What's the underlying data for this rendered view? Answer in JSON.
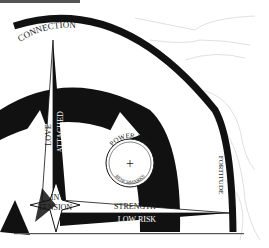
{
  "diagram": {
    "type": "compass-rose",
    "colors": {
      "ink": "#111111",
      "paper": "#ffffff",
      "contour": "#d8d8d8",
      "rule": "#555555"
    },
    "labels": {
      "north": "CONNECTION",
      "east": "FORTITUDE",
      "north_arm_left": "LOVE",
      "north_arm_right": "ATTACHED",
      "east_arm_top": "STRENGTH",
      "east_arm_bottom": "LOW RISK",
      "center_top": "IN",
      "center_bottom": "TENSION",
      "badge_top": "POWER FOR",
      "badge_bottom": "BENCHMARKS",
      "badge_symbol": "+"
    }
  }
}
